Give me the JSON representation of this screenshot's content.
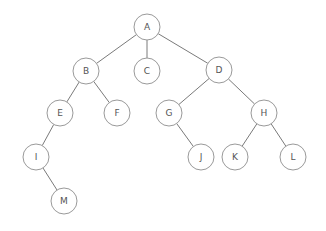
{
  "diagram": {
    "type": "tree",
    "colors": {
      "edge": "#7a7a7a",
      "node_stroke": "#9a9a9a",
      "node_fill": "#ffffff",
      "label": "#555555"
    },
    "node_radius": 13,
    "nodes": [
      {
        "id": "A",
        "label": "A",
        "x": 147,
        "y": 27
      },
      {
        "id": "B",
        "label": "B",
        "x": 86,
        "y": 71
      },
      {
        "id": "C",
        "label": "C",
        "x": 147,
        "y": 71
      },
      {
        "id": "D",
        "label": "D",
        "x": 219,
        "y": 70
      },
      {
        "id": "E",
        "label": "E",
        "x": 60,
        "y": 113
      },
      {
        "id": "F",
        "label": "F",
        "x": 117,
        "y": 113
      },
      {
        "id": "G",
        "label": "G",
        "x": 169,
        "y": 113
      },
      {
        "id": "H",
        "label": "H",
        "x": 264,
        "y": 113
      },
      {
        "id": "I",
        "label": "I",
        "x": 36,
        "y": 157
      },
      {
        "id": "J",
        "label": "J",
        "x": 201,
        "y": 157
      },
      {
        "id": "K",
        "label": "K",
        "x": 235,
        "y": 157
      },
      {
        "id": "L",
        "label": "L",
        "x": 293,
        "y": 157
      },
      {
        "id": "M",
        "label": "M",
        "x": 64,
        "y": 201
      }
    ],
    "edges": [
      [
        "A",
        "B"
      ],
      [
        "A",
        "C"
      ],
      [
        "A",
        "D"
      ],
      [
        "B",
        "E"
      ],
      [
        "B",
        "F"
      ],
      [
        "D",
        "G"
      ],
      [
        "D",
        "H"
      ],
      [
        "E",
        "I"
      ],
      [
        "I",
        "M"
      ],
      [
        "G",
        "J"
      ],
      [
        "H",
        "K"
      ],
      [
        "H",
        "L"
      ]
    ]
  }
}
